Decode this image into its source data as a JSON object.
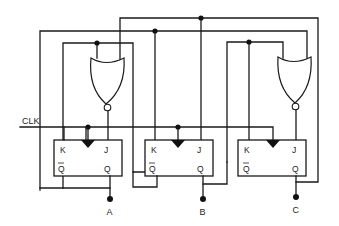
{
  "diagram": {
    "type": "synchronous counter circuit",
    "clock_label": "CLK",
    "outputs": [
      "A",
      "B",
      "C"
    ],
    "flip_flops": [
      {
        "id": "ff-a",
        "pins": {
          "k": "K",
          "j": "J",
          "qbar": "Q",
          "q": "Q"
        },
        "output": "A"
      },
      {
        "id": "ff-b",
        "pins": {
          "k": "K",
          "j": "J",
          "qbar": "Q",
          "q": "Q"
        },
        "output": "B"
      },
      {
        "id": "ff-c",
        "pins": {
          "k": "K",
          "j": "J",
          "qbar": "Q",
          "q": "Q"
        },
        "output": "C"
      }
    ],
    "gates": [
      {
        "id": "nor-1",
        "type": "NOR",
        "drives": "ff-a J"
      },
      {
        "id": "nor-2",
        "type": "NOR",
        "drives": "ff-c J"
      }
    ],
    "colors": {
      "line": "#1a1a1a",
      "background": "#ffffff"
    }
  }
}
